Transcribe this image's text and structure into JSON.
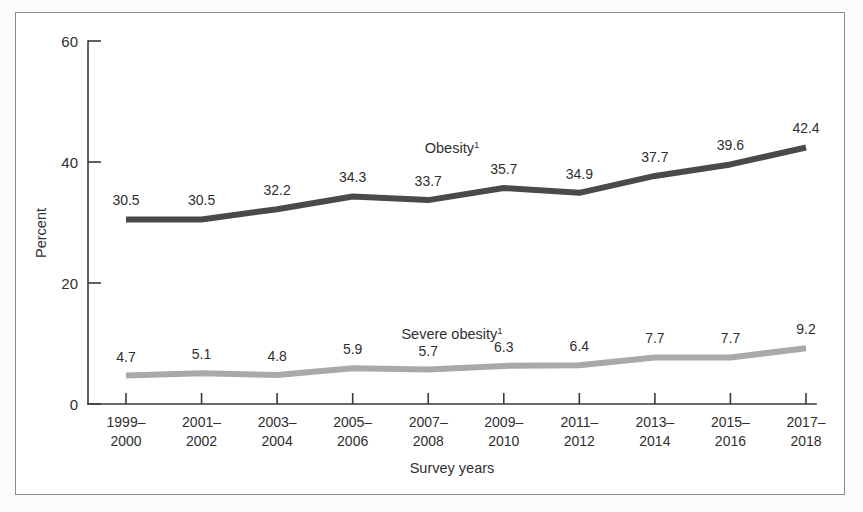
{
  "figure": {
    "background_color": "#ffffff",
    "border_color": "#8d8d8d"
  },
  "axes": {
    "y_title": "Percent",
    "x_title": "Survey years",
    "y_ticks": [
      "0",
      "20",
      "40",
      "60"
    ],
    "y_min": 0,
    "y_max": 60
  },
  "chart_data": {
    "type": "line",
    "title": "",
    "subtitle": "",
    "xlabel": "Survey years",
    "ylabel": "Percent",
    "ylim": [
      0,
      60
    ],
    "yticks": [
      0,
      20,
      40,
      60
    ],
    "grid": false,
    "legend_position": "inline-labels",
    "categories": [
      "1999–\n2000",
      "2001–\n2002",
      "2003–\n2004",
      "2005–\n2006",
      "2007–\n2008",
      "2009–\n2010",
      "2011–\n2012",
      "2013–\n2014",
      "2015–\n2016",
      "2017–\n2018"
    ],
    "category_lines": [
      [
        "1999–",
        "2000"
      ],
      [
        "2001–",
        "2002"
      ],
      [
        "2003–",
        "2004"
      ],
      [
        "2005–",
        "2006"
      ],
      [
        "2007–",
        "2008"
      ],
      [
        "2009–",
        "2010"
      ],
      [
        "2011–",
        "2012"
      ],
      [
        "2013–",
        "2014"
      ],
      [
        "2015–",
        "2016"
      ],
      [
        "2017–",
        "2018"
      ]
    ],
    "series": [
      {
        "name": "Obesity",
        "label": "Obesity",
        "footnote_marker": "1",
        "color": "#4a4a4a",
        "values": [
          30.5,
          30.5,
          32.2,
          34.3,
          33.7,
          35.7,
          34.9,
          37.7,
          39.6,
          42.4
        ],
        "value_labels": [
          "30.5",
          "30.5",
          "32.2",
          "34.3",
          "33.7",
          "35.7",
          "34.9",
          "37.7",
          "39.6",
          "42.4"
        ]
      },
      {
        "name": "Severe obesity",
        "label": "Severe obesity",
        "footnote_marker": "1",
        "color": "#a9a9a9",
        "values": [
          4.7,
          5.1,
          4.8,
          5.9,
          5.7,
          6.3,
          6.4,
          7.7,
          7.7,
          9.2
        ],
        "value_labels": [
          "4.7",
          "5.1",
          "4.8",
          "5.9",
          "5.7",
          "6.3",
          "6.4",
          "7.7",
          "7.7",
          "9.2"
        ]
      }
    ]
  }
}
